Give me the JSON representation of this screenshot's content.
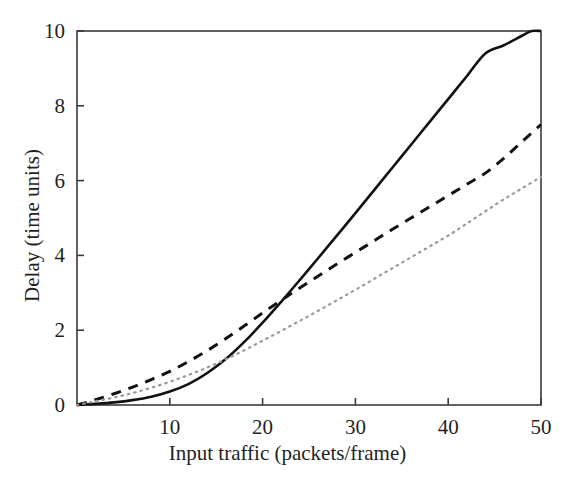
{
  "chart_data": {
    "type": "line",
    "title": "",
    "xlabel": "Input traffic (packets/frame)",
    "ylabel": "Delay (time units)",
    "xlim": [
      0,
      50
    ],
    "ylim": [
      0,
      10
    ],
    "xticks": [
      10,
      20,
      30,
      40,
      50
    ],
    "yticks": [
      0,
      2,
      4,
      6,
      8,
      10
    ],
    "xtick_labels": [
      "10",
      "20",
      "30",
      "40",
      "50"
    ],
    "ytick_labels": [
      "0",
      "2",
      "4",
      "6",
      "8",
      "10"
    ],
    "grid": false,
    "legend": "none",
    "background_color": "#ffffff",
    "axis_color": "#3a3a3a",
    "series": [
      {
        "name": "solid-curve",
        "style": "solid",
        "color": "#111111",
        "width": 2.6,
        "x": [
          0,
          2,
          4,
          6,
          8,
          10,
          12,
          14,
          16,
          18,
          20,
          22,
          24,
          26,
          28,
          30,
          32,
          34,
          36,
          38,
          40,
          42,
          44,
          46,
          48,
          49,
          50
        ],
        "y": [
          0.0,
          0.03,
          0.07,
          0.13,
          0.22,
          0.36,
          0.56,
          0.85,
          1.22,
          1.68,
          2.2,
          2.76,
          3.34,
          3.93,
          4.53,
          5.13,
          5.74,
          6.35,
          6.96,
          7.57,
          8.18,
          8.79,
          9.4,
          9.62,
          9.88,
          10.0,
          10.0
        ]
      },
      {
        "name": "dashed-curve",
        "style": "dashed",
        "color": "#111111",
        "width": 3.0,
        "dash_pattern": [
          10,
          8
        ],
        "x": [
          0,
          2,
          4,
          6,
          8,
          10,
          12,
          14,
          16,
          18,
          20,
          22,
          24,
          26,
          28,
          30,
          32,
          34,
          36,
          38,
          40,
          42,
          44,
          46,
          48,
          50
        ],
        "y": [
          0.0,
          0.14,
          0.3,
          0.48,
          0.68,
          0.9,
          1.16,
          1.45,
          1.77,
          2.11,
          2.46,
          2.8,
          3.13,
          3.45,
          3.77,
          4.08,
          4.39,
          4.7,
          5.0,
          5.3,
          5.6,
          5.9,
          6.2,
          6.6,
          7.05,
          7.5
        ]
      },
      {
        "name": "dotted-curve",
        "style": "dotted",
        "color": "#9a9a9a",
        "width": 2.2,
        "dash_pattern": [
          1.5,
          5
        ],
        "x": [
          0,
          2,
          4,
          6,
          8,
          10,
          12,
          14,
          16,
          18,
          20,
          22,
          24,
          26,
          28,
          30,
          32,
          34,
          36,
          38,
          40,
          42,
          44,
          46,
          48,
          50
        ],
        "y": [
          0.0,
          0.1,
          0.2,
          0.32,
          0.46,
          0.62,
          0.8,
          1.0,
          1.22,
          1.46,
          1.72,
          1.98,
          2.25,
          2.52,
          2.8,
          3.08,
          3.37,
          3.66,
          3.95,
          4.24,
          4.53,
          4.85,
          5.18,
          5.5,
          5.8,
          6.1
        ]
      }
    ]
  },
  "axes": {
    "plot_left_px": 77,
    "plot_right_px": 541,
    "plot_top_px": 31,
    "plot_bottom_px": 405
  }
}
